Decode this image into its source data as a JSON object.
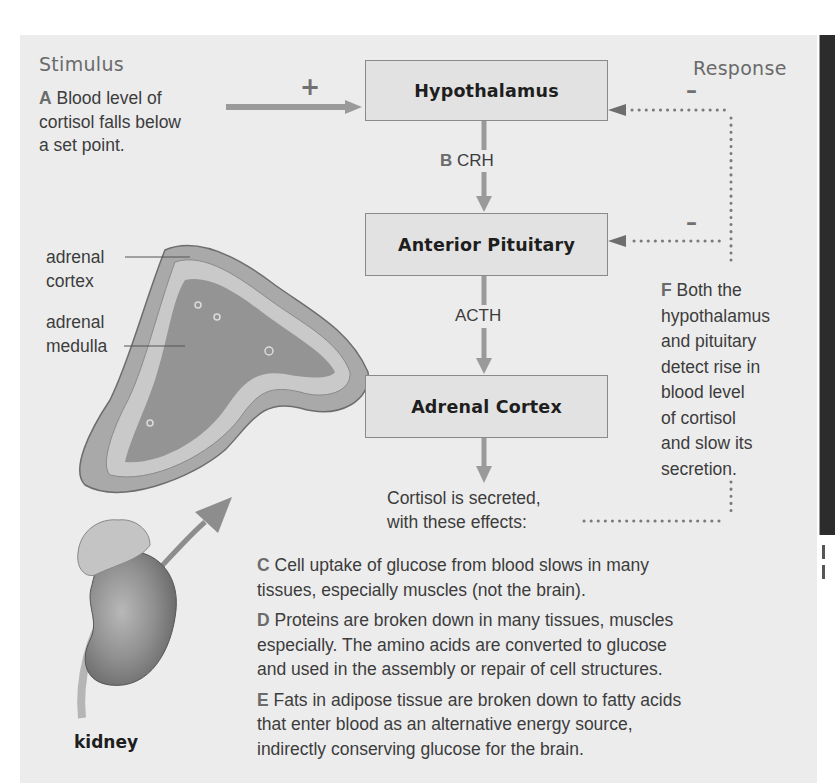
{
  "diagram": {
    "title_left": "Stimulus",
    "title_right": "Response",
    "stimulus": {
      "letter": "A",
      "text": "Blood level of cortisol falls below a set point.",
      "lines": [
        "Blood level of",
        "cortisol falls below",
        "a set point."
      ]
    },
    "stimulus_sign": "+",
    "nodes": [
      {
        "id": "hypothalamus",
        "label": "Hypothalamus"
      },
      {
        "id": "anterior-pituitary",
        "label": "Anterior Pituitary"
      },
      {
        "id": "adrenal-cortex",
        "label": "Adrenal Cortex"
      }
    ],
    "edges": [
      {
        "from": "hypothalamus",
        "to": "anterior-pituitary",
        "letter": "B",
        "label": "CRH"
      },
      {
        "from": "anterior-pituitary",
        "to": "adrenal-cortex",
        "letter": "",
        "label": "ACTH"
      }
    ],
    "feedback": {
      "sign_top": "–",
      "sign_bottom": "–",
      "letter": "F",
      "lines": [
        "Both the",
        "hypothalamus",
        "and pituitary",
        "detect rise in",
        "blood level",
        "of cortisol",
        "and slow its",
        "secretion."
      ]
    },
    "output": {
      "lines": [
        "Cortisol is secreted,",
        "with these effects:"
      ]
    },
    "effects": [
      {
        "letter": "C",
        "lines": [
          "Cell uptake of glucose from blood slows in many",
          "tissues, especially muscles (not the brain)."
        ]
      },
      {
        "letter": "D",
        "lines": [
          "Proteins are broken down in many tissues, muscles",
          "especially. The amino acids are converted to glucose",
          "and used in the assembly or repair of cell structures."
        ]
      },
      {
        "letter": "E",
        "lines": [
          "Fats in adipose tissue are broken down to fatty acids",
          "that enter blood as an alternative energy source,",
          "indirectly conserving glucose for the brain."
        ]
      }
    ],
    "illustration": {
      "labels": {
        "cortex": [
          "adrenal",
          "cortex"
        ],
        "medulla": [
          "adrenal",
          "medulla"
        ],
        "kidney": "kidney"
      }
    },
    "colors": {
      "panel_bg": "#ececec",
      "box_bg": "#e2e2e2",
      "box_border": "#8a8a8a",
      "arrow": "#9a9a9a",
      "dotted": "#7a7a7a"
    }
  }
}
